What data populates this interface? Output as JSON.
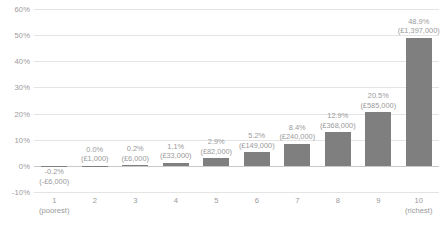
{
  "chart_data": {
    "type": "bar",
    "title": "",
    "subtitle": "",
    "xlabel": "",
    "ylabel": "",
    "categories": [
      "1",
      "2",
      "3",
      "4",
      "5",
      "6",
      "7",
      "8",
      "9",
      "10"
    ],
    "category_sublabels": [
      "(poorest)",
      "",
      "",
      "",
      "",
      "",
      "",
      "",
      "",
      "(richest)"
    ],
    "values": [
      -0.2,
      0.0,
      0.2,
      1.1,
      2.9,
      5.2,
      8.4,
      12.9,
      20.5,
      48.9
    ],
    "value_labels": [
      "-0.2%",
      "0.0%",
      "0.2%",
      "1.1%",
      "2.9%",
      "5.2%",
      "8.4%",
      "12.9%",
      "20.5%",
      "48.9%"
    ],
    "amount_labels": [
      "(-£6,000)",
      "(£1,000)",
      "(£6,000)",
      "(£33,000)",
      "(£82,000)",
      "(£149,000)",
      "(£240,000)",
      "(£368,000)",
      "(£585,000)",
      "(£1,397,000)"
    ],
    "ylim": [
      -10,
      60
    ],
    "yticks": [
      60,
      50,
      40,
      30,
      20,
      10,
      0,
      -10
    ],
    "ytick_labels": [
      "60%",
      "50%",
      "40%",
      "30%",
      "20%",
      "10%",
      "0%",
      "-10%"
    ],
    "grid": true,
    "legend": false,
    "bar_color": "#7f7f7f",
    "gridline_color": "#e4e4e4",
    "zero_line_color": "#c9c9c9",
    "text_color": "#9a9a9a"
  }
}
